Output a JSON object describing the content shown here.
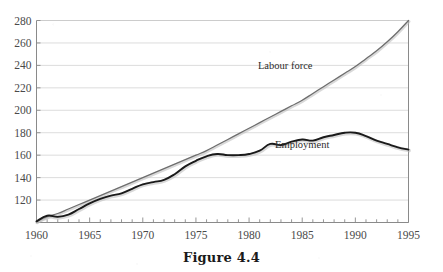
{
  "figure": {
    "caption": "Figure 4.4"
  },
  "chart_data": {
    "type": "line",
    "title": "",
    "xlabel": "",
    "ylabel": "",
    "xlim": [
      1960,
      1995
    ],
    "ylim": [
      100,
      280
    ],
    "y_ticks": [
      120,
      140,
      160,
      180,
      200,
      220,
      240,
      260,
      280
    ],
    "x_ticks": [
      1960,
      1965,
      1970,
      1975,
      1980,
      1985,
      1990,
      1995
    ],
    "x_minor_tick_step": 1,
    "grid": "horizontal",
    "legend": "inline-annotations",
    "annotations": [
      {
        "text": "Labour force",
        "x": 1983.4,
        "y": 237
      },
      {
        "text": "Employment",
        "x": 1985.0,
        "y": 166
      }
    ],
    "x": [
      1960,
      1961,
      1962,
      1963,
      1964,
      1965,
      1966,
      1967,
      1968,
      1969,
      1970,
      1971,
      1972,
      1973,
      1974,
      1975,
      1976,
      1977,
      1978,
      1979,
      1980,
      1981,
      1982,
      1983,
      1984,
      1985,
      1986,
      1987,
      1988,
      1989,
      1990,
      1991,
      1992,
      1993,
      1994,
      1995
    ],
    "series": [
      {
        "name": "Labour force",
        "color": "#6e6e6e",
        "values": [
          101,
          105,
          108,
          112,
          116,
          120,
          124,
          128,
          132,
          136,
          140,
          144,
          148,
          152,
          156,
          160,
          164,
          169,
          174,
          179,
          184,
          189,
          194,
          199,
          204,
          209,
          215,
          221,
          227,
          233,
          239,
          246,
          253,
          261,
          270,
          280
        ]
      },
      {
        "name": "Employment",
        "color": "#1a1a1a",
        "values": [
          101,
          106,
          105,
          107,
          112,
          117,
          121,
          124,
          126,
          130,
          134,
          136,
          138,
          143,
          150,
          155,
          159,
          161,
          160,
          160,
          161,
          164,
          170,
          169,
          172,
          174,
          173,
          176,
          178,
          180,
          180,
          177,
          173,
          170,
          167,
          165
        ]
      }
    ]
  }
}
